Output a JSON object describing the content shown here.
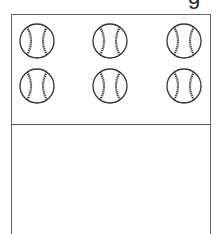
{
  "header": {
    "partial_text": "g"
  },
  "top_panel": {
    "rows": 2,
    "columns": 3,
    "items": [
      {
        "icon": "baseball-icon",
        "cx": 37,
        "cy": 41
      },
      {
        "icon": "baseball-icon",
        "cx": 110,
        "cy": 41
      },
      {
        "icon": "baseball-icon",
        "cx": 184,
        "cy": 41
      },
      {
        "icon": "baseball-icon",
        "cx": 37,
        "cy": 86
      },
      {
        "icon": "baseball-icon",
        "cx": 110,
        "cy": 86
      },
      {
        "icon": "baseball-icon",
        "cx": 184,
        "cy": 86
      }
    ]
  },
  "bottom_panel": {
    "content": ""
  },
  "colors": {
    "border": "#666666",
    "ball_outline": "#333333",
    "background": "#ffffff"
  }
}
